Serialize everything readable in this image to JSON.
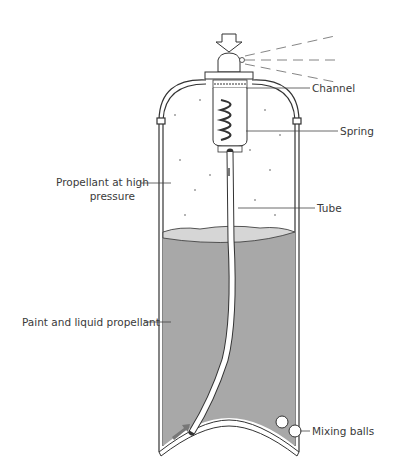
{
  "diagram": {
    "labels": {
      "channel": "Channel",
      "spring": "Spring",
      "propellant_gas_line1": "Propellant at high",
      "propellant_gas_line2": "pressure",
      "tube": "Tube",
      "paint_liquid": "Paint and liquid propellant",
      "mixing_balls": "Mixing balls"
    },
    "colors": {
      "liquid_fill": "#a8a8a8",
      "foam_surface": "#d6d6d6",
      "outline": "#333333",
      "arrow_fill": "#777777",
      "text": "#3a3a3a"
    }
  }
}
